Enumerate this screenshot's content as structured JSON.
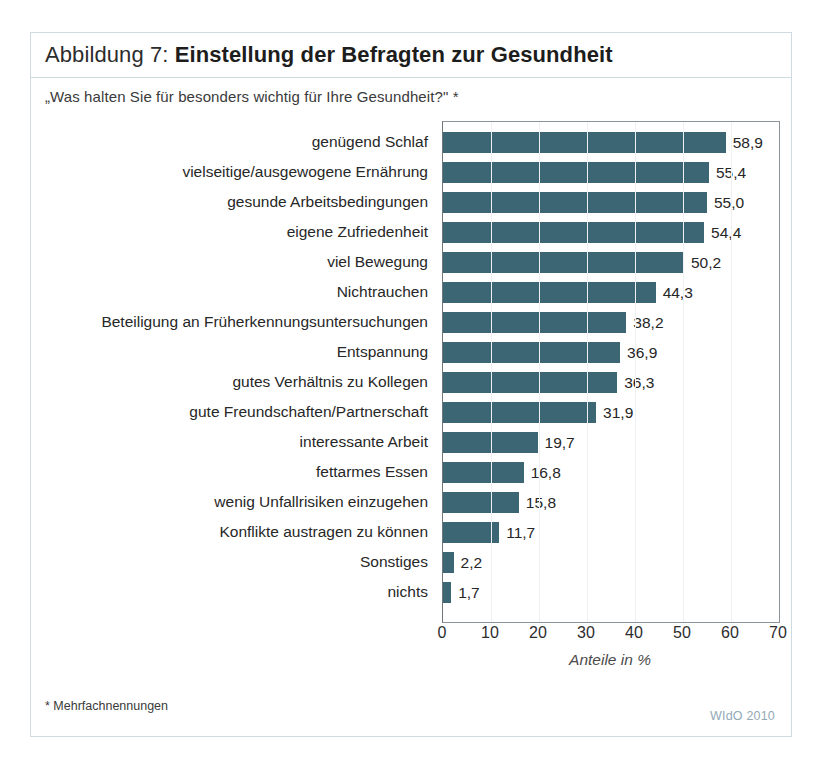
{
  "figure": {
    "number_label": "Abbildung 7: ",
    "title": "Einstellung der Befragten zur Gesundheit",
    "question": "„Was halten Sie für besonders wichtig für Ihre Gesundheit?\" *",
    "footnote": "* Mehrfachnennungen",
    "source": "WIdO 2010",
    "frame_color": "#cfdbe3",
    "bar_color": "#3c6673",
    "source_color": "#93a9b6"
  },
  "chart_data": {
    "type": "bar",
    "orientation": "horizontal",
    "title": "Einstellung der Befragten zur Gesundheit",
    "subtitle": "„Was halten Sie für besonders wichtig für Ihre Gesundheit?\" *",
    "xlabel": "Anteile in %",
    "ylabel": "",
    "xlim": [
      0,
      70
    ],
    "xticks": [
      0,
      10,
      20,
      30,
      40,
      50,
      60,
      70
    ],
    "xtick_labels": [
      "0",
      "10",
      "20",
      "30",
      "40",
      "50",
      "60",
      "70"
    ],
    "grid": true,
    "legend": false,
    "decimal_separator": ",",
    "categories": [
      "genügend Schlaf",
      "vielseitige/ausgewogene Ernährung",
      "gesunde Arbeitsbedingungen",
      "eigene Zufriedenheit",
      "viel Bewegung",
      "Nichtrauchen",
      "Beteiligung an Früherkennungsuntersuchungen",
      "Entspannung",
      "gutes Verhältnis zu Kollegen",
      "gute Freundschaften/Partnerschaft",
      "interessante Arbeit",
      "fettarmes Essen",
      "wenig Unfallrisiken einzugehen",
      "Konflikte austragen zu können",
      "Sonstiges",
      "nichts"
    ],
    "values": [
      58.9,
      55.4,
      55.0,
      54.4,
      50.2,
      44.3,
      38.2,
      36.9,
      36.3,
      31.9,
      19.7,
      16.8,
      15.8,
      11.7,
      2.2,
      1.7
    ],
    "value_labels": [
      "58,9",
      "55,4",
      "55,0",
      "54,4",
      "50,2",
      "44,3",
      "38,2",
      "36,9",
      "36,3",
      "31,9",
      "19,7",
      "16,8",
      "15,8",
      "11,7",
      "2,2",
      "1,7"
    ]
  }
}
